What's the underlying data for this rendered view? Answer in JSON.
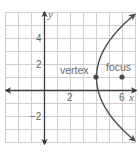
{
  "chart_data": {
    "type": "line",
    "title": "",
    "xlabel": "x",
    "ylabel": "y",
    "xlim": [
      -3,
      7
    ],
    "ylim": [
      -4,
      6
    ],
    "grid": true,
    "x_tick_labels": [
      {
        "value": 2,
        "label": "2"
      },
      {
        "value": 6,
        "label": "6"
      }
    ],
    "y_tick_labels": [
      {
        "value": 4,
        "label": "4"
      },
      {
        "value": 2,
        "label": "2"
      },
      {
        "value": -2,
        "label": "−2"
      }
    ],
    "series": [
      {
        "name": "parabola",
        "equation": "(y-1)^2 = 8(x-4)",
        "y_range": [
          -3.85,
          5.85
        ],
        "arrows_at_ends": true
      }
    ],
    "points": [
      {
        "name": "vertex",
        "label": "vertex",
        "x": 4,
        "y": 1
      },
      {
        "name": "focus",
        "label": "focus",
        "x": 6,
        "y": 1
      }
    ]
  },
  "colors": {
    "grid": "#cfcfcf",
    "axis": "#3a3a3a",
    "curve": "#4a4a4a",
    "text": "#666666"
  },
  "labels": {
    "x_axis": "x",
    "y_axis": "y",
    "tick_x_2": "2",
    "tick_x_6": "6",
    "tick_y_4": "4",
    "tick_y_2": "2",
    "tick_y_neg2": "−2",
    "vertex": "vertex",
    "focus": "focus"
  }
}
